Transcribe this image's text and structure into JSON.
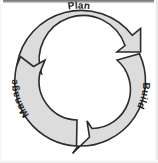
{
  "figure": {
    "type": "cycle-diagram",
    "background_color": "#ffffff",
    "segment_fill_color": "#dcdcdc",
    "segment_stroke_color": "#2b2b2b",
    "label_color": "#1f1f1f",
    "center": {
      "x": 79,
      "y": 81
    },
    "outer_radius": 65,
    "inner_radius": 39
  },
  "segments": [
    {
      "id": "plan",
      "label": "Plan",
      "position": "top",
      "start_angle_deg": 200,
      "end_angle_deg": 320,
      "label_rotation_deg": 0
    },
    {
      "id": "build",
      "label": "Build",
      "position": "right",
      "start_angle_deg": 320,
      "end_angle_deg": 80,
      "label_rotation_deg": 90
    },
    {
      "id": "manage",
      "label": "Manage",
      "position": "left",
      "start_angle_deg": 80,
      "end_angle_deg": 200,
      "label_rotation_deg": 250
    }
  ],
  "arrowheads": [
    {
      "id": "arrow-plan-to-build",
      "position": "top-right"
    },
    {
      "id": "arrow-build-to-manage",
      "position": "bottom"
    },
    {
      "id": "arrow-manage-to-plan",
      "position": "left"
    }
  ]
}
